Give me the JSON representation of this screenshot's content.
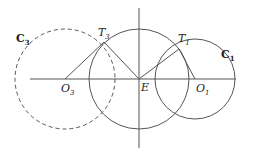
{
  "diagram": {
    "title": "",
    "colors": {
      "stroke": "#555555",
      "text": "#222222",
      "background": "#ffffff"
    },
    "axes": {
      "horizontal": {
        "x1": 30,
        "y1": 79,
        "x2": 236,
        "y2": 79
      },
      "vertical": {
        "x1": 139,
        "y1": 8,
        "x2": 139,
        "y2": 148
      }
    },
    "circles": [
      {
        "id": "central",
        "cx": 139,
        "cy": 79,
        "r": 50,
        "style": "solid",
        "label": ""
      },
      {
        "id": "C1",
        "cx": 195,
        "cy": 79,
        "r": 40,
        "style": "solid",
        "label": "C",
        "label_sub": "1"
      },
      {
        "id": "C3",
        "cx": 65,
        "cy": 79,
        "r": 50,
        "style": "dashed",
        "label": "C",
        "label_sub": "3"
      }
    ],
    "points": {
      "E": {
        "x": 139,
        "y": 79,
        "label": "E"
      },
      "O1": {
        "x": 195,
        "y": 79,
        "label": "O",
        "sub": "1"
      },
      "O3": {
        "x": 65,
        "y": 79,
        "label": "O",
        "sub": "3"
      },
      "T1": {
        "x": 179,
        "y": 49,
        "label": "T",
        "sub": "1"
      },
      "T3": {
        "x": 104,
        "y": 42,
        "label": "T",
        "sub": "3"
      }
    },
    "segments": [
      {
        "from": "E",
        "to": "T1"
      },
      {
        "from": "T1",
        "to": "O1"
      },
      {
        "from": "E",
        "to": "T3"
      },
      {
        "from": "T3",
        "to": "O3"
      }
    ],
    "labels": {
      "C1": {
        "main": "C",
        "sub": "1"
      },
      "C3": {
        "main": "C",
        "sub": "3"
      },
      "T1": {
        "main": "T",
        "sub": "1"
      },
      "T3": {
        "main": "T",
        "sub": "3"
      },
      "O1": {
        "main": "O",
        "sub": "1"
      },
      "O3": {
        "main": "O",
        "sub": "3"
      },
      "E": {
        "main": "E"
      }
    }
  }
}
